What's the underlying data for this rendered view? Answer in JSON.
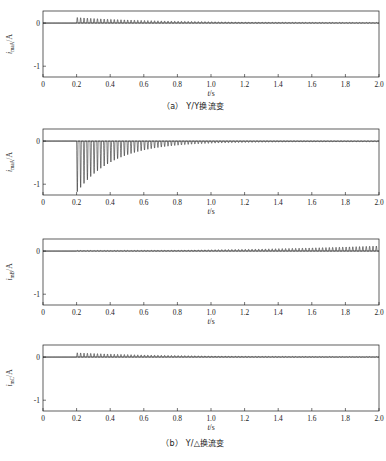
{
  "figure": {
    "panels": [
      {
        "id": "panel-a1",
        "ylabel_main": "i",
        "ylabel_sub": "maA",
        "ylabel_unit": "/A",
        "xlabel": "t/s",
        "xlabel_main": "t",
        "xlabel_unit": "/s"
      },
      {
        "id": "panel-a2",
        "ylabel_main": "i",
        "ylabel_sub": "maA",
        "ylabel_unit": "/A",
        "xlabel": "t/s",
        "xlabel_main": "t",
        "xlabel_unit": "/s"
      },
      {
        "id": "panel-b1",
        "ylabel_main": "i",
        "ylabel_sub": "mB",
        "ylabel_unit": "/A",
        "xlabel": "t/s",
        "xlabel_main": "t",
        "xlabel_unit": "/s"
      },
      {
        "id": "panel-b2",
        "ylabel_main": "i",
        "ylabel_sub": "mC",
        "ylabel_unit": "/A",
        "xlabel": "t/s",
        "xlabel_main": "t",
        "xlabel_unit": "/s"
      }
    ],
    "captions": [
      {
        "id": "caption-a",
        "prefix": "（a）",
        "text": "Y/Y换流变"
      },
      {
        "id": "caption-b",
        "prefix": "（b）",
        "text": "Y/△换流变"
      }
    ]
  },
  "chart_data": [
    {
      "type": "line",
      "title": "",
      "panel": "a1",
      "xlabel": "t/s",
      "ylabel": "i_maA/A",
      "xlim": [
        0,
        2.0
      ],
      "ylim": [
        -1.25,
        0.28
      ],
      "xticks": [
        0,
        0.2,
        0.4,
        0.6,
        0.8,
        1.0,
        1.2,
        1.4,
        1.6,
        1.8,
        2.0
      ],
      "xticklabels": [
        "0",
        "0.2",
        "0.4",
        "0.6",
        "0.8",
        "1.0",
        "1.2",
        "1.4",
        "1.6",
        "1.8",
        "2.0"
      ],
      "yticks": [
        0,
        -1
      ],
      "yticklabels": [
        "0",
        "-1"
      ],
      "grid": false,
      "legend": null,
      "description": "Zero until t=0.2 s, then decaying positive inrush spikes; envelope decays from 0.13 A to near 0.01 A by t=2.0 s",
      "series": [
        {
          "name": "i_maA",
          "inrush_start": 0.2,
          "polarity": "positive",
          "peak_value": 0.13,
          "final_value": 0.012,
          "period": 0.02,
          "decay_tau": 0.45
        }
      ]
    },
    {
      "type": "line",
      "title": "",
      "panel": "a2",
      "xlabel": "t/s",
      "ylabel": "i_maA/A",
      "xlim": [
        0,
        2.0
      ],
      "ylim": [
        -1.25,
        0.28
      ],
      "xticks": [
        0,
        0.2,
        0.4,
        0.6,
        0.8,
        1.0,
        1.2,
        1.4,
        1.6,
        1.8,
        2.0
      ],
      "xticklabels": [
        "0",
        "0.2",
        "0.4",
        "0.6",
        "0.8",
        "1.0",
        "1.2",
        "1.4",
        "1.6",
        "1.8",
        "2.0"
      ],
      "yticks": [
        0,
        -1
      ],
      "yticklabels": [
        "0",
        "-1"
      ],
      "grid": false,
      "legend": null,
      "description": "Zero until t=0.2 s, then large negative inrush spikes reaching -1.2 A, decaying exponentially to near zero by t=1.4 s",
      "series": [
        {
          "name": "i_maA",
          "inrush_start": 0.2,
          "polarity": "negative",
          "peak_value": -1.2,
          "final_value": -0.02,
          "period": 0.02,
          "decay_tau": 0.22
        }
      ]
    },
    {
      "type": "line",
      "title": "",
      "panel": "b1",
      "xlabel": "t/s",
      "ylabel": "i_mB/A",
      "xlim": [
        0,
        2.0
      ],
      "ylim": [
        -1.25,
        0.28
      ],
      "xticks": [
        0,
        0.2,
        0.4,
        0.6,
        0.8,
        1.0,
        1.2,
        1.4,
        1.6,
        1.8,
        2.0
      ],
      "xticklabels": [
        "0",
        "0.2",
        "0.4",
        "0.6",
        "0.8",
        "1.0",
        "1.2",
        "1.4",
        "1.6",
        "1.8",
        "2.0"
      ],
      "yticks": [
        0,
        -1
      ],
      "yticklabels": [
        "0",
        "-1"
      ],
      "grid": false,
      "legend": null,
      "description": "Small ripple from t=0.2 s that grows steadily, reaching maximum amplitude about 0.12 A at t=2.0 s",
      "series": [
        {
          "name": "i_mB",
          "inrush_start": 0.2,
          "polarity": "positive",
          "peak_value": 0.12,
          "final_value": 0.12,
          "period": 0.02,
          "growth": "increasing"
        }
      ]
    },
    {
      "type": "line",
      "title": "",
      "panel": "b2",
      "xlabel": "t/s",
      "ylabel": "i_mC/A",
      "xlim": [
        0,
        2.0
      ],
      "ylim": [
        -1.25,
        0.28
      ],
      "xticks": [
        0,
        0.2,
        0.4,
        0.6,
        0.8,
        1.0,
        1.2,
        1.4,
        1.6,
        1.8,
        2.0
      ],
      "xticklabels": [
        "0",
        "0.2",
        "0.4",
        "0.6",
        "0.8",
        "1.0",
        "1.2",
        "1.4",
        "1.6",
        "1.8",
        "2.0"
      ],
      "yticks": [
        0,
        -1
      ],
      "yticklabels": [
        "0",
        "-1"
      ],
      "grid": false,
      "legend": null,
      "description": "Zero until t=0.2 s, then decaying positive spikes similar to panel a1 but slightly smaller",
      "series": [
        {
          "name": "i_mC",
          "inrush_start": 0.2,
          "polarity": "positive",
          "peak_value": 0.1,
          "final_value": 0.008,
          "period": 0.02,
          "decay_tau": 0.5
        }
      ]
    }
  ]
}
